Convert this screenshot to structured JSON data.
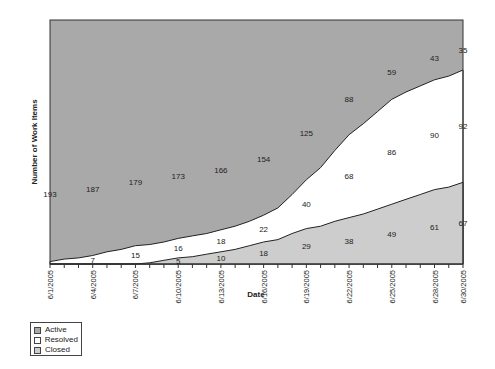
{
  "chart_data": {
    "type": "area",
    "stacked": true,
    "title": "",
    "xlabel": "Date",
    "ylabel": "Number of Work Items",
    "ylim": [
      0,
      200
    ],
    "x": [
      "6/1/2005",
      "6/2/2005",
      "6/3/2005",
      "6/4/2005",
      "6/5/2005",
      "6/6/2005",
      "6/7/2005",
      "6/8/2005",
      "6/9/2005",
      "6/10/2005",
      "6/11/2005",
      "6/12/2005",
      "6/13/2005",
      "6/14/2005",
      "6/15/2005",
      "6/16/2005",
      "6/17/2005",
      "6/18/2005",
      "6/19/2005",
      "6/20/2005",
      "6/21/2005",
      "6/22/2005",
      "6/23/2005",
      "6/24/2005",
      "6/25/2005",
      "6/26/2005",
      "6/27/2005",
      "6/28/2005",
      "6/29/2005",
      "6/30/2005"
    ],
    "tick_labels": [
      "6/1/2005",
      "6/4/2005",
      "6/7/2005",
      "6/10/2005",
      "6/13/2005",
      "6/16/2005",
      "6/19/2005",
      "6/22/2005",
      "6/25/2005",
      "6/28/2005",
      "6/30/2005"
    ],
    "stack_order": [
      "Closed",
      "Resolved",
      "Active"
    ],
    "series": [
      {
        "name": "Closed",
        "color": "#cdcdcd",
        "values": [
          0,
          0,
          0,
          0,
          0,
          0,
          0,
          1,
          3,
          5,
          6,
          8,
          10,
          12,
          15,
          18,
          20,
          25,
          29,
          31,
          35,
          38,
          41,
          45,
          49,
          53,
          57,
          61,
          63,
          67
        ]
      },
      {
        "name": "Resolved",
        "color": "#ffffff",
        "values": [
          2,
          4,
          5,
          7,
          10,
          12,
          15,
          15,
          15,
          16,
          17,
          17,
          18,
          19,
          20,
          22,
          26,
          32,
          40,
          48,
          58,
          68,
          74,
          80,
          86,
          88,
          89,
          90,
          91,
          92
        ]
      },
      {
        "name": "Active",
        "color": "#a9a9a9",
        "values": [
          193,
          191,
          189,
          187,
          184,
          181,
          179,
          177,
          175,
          173,
          171,
          169,
          166,
          162,
          158,
          154,
          146,
          136,
          125,
          113,
          100,
          88,
          78,
          68,
          59,
          54,
          48,
          43,
          40,
          35
        ]
      }
    ],
    "data_labels": {
      "Active": [
        {
          "x": "6/1/2005",
          "value": 193
        },
        {
          "x": "6/4/2005",
          "value": 187
        },
        {
          "x": "6/7/2005",
          "value": 179
        },
        {
          "x": "6/10/2005",
          "value": 173
        },
        {
          "x": "6/13/2005",
          "value": 166
        },
        {
          "x": "6/16/2005",
          "value": 154
        },
        {
          "x": "6/19/2005",
          "value": 125
        },
        {
          "x": "6/22/2005",
          "value": 88
        },
        {
          "x": "6/25/2005",
          "value": 59
        },
        {
          "x": "6/28/2005",
          "value": 43
        },
        {
          "x": "6/30/2005",
          "value": 35
        }
      ],
      "Resolved": [
        {
          "x": "6/4/2005",
          "value": 7
        },
        {
          "x": "6/7/2005",
          "value": 15
        },
        {
          "x": "6/10/2005",
          "value": 16
        },
        {
          "x": "6/13/2005",
          "value": 18
        },
        {
          "x": "6/16/2005",
          "value": 22
        },
        {
          "x": "6/19/2005",
          "value": 40
        },
        {
          "x": "6/22/2005",
          "value": 68
        },
        {
          "x": "6/25/2005",
          "value": 86
        },
        {
          "x": "6/28/2005",
          "value": 90
        },
        {
          "x": "6/30/2005",
          "value": 92
        }
      ],
      "Closed": [
        {
          "x": "6/10/2005",
          "value": 5
        },
        {
          "x": "6/13/2005",
          "value": 10
        },
        {
          "x": "6/16/2005",
          "value": 18
        },
        {
          "x": "6/19/2005",
          "value": 29
        },
        {
          "x": "6/22/2005",
          "value": 38
        },
        {
          "x": "6/25/2005",
          "value": 49
        },
        {
          "x": "6/28/2005",
          "value": 61
        },
        {
          "x": "6/30/2005",
          "value": 67
        }
      ]
    },
    "legend": {
      "position": "bottom-left",
      "entries": [
        "Active",
        "Resolved",
        "Closed"
      ]
    },
    "grid": false
  },
  "legend": {
    "items": [
      {
        "label": "Active",
        "color": "#a9a9a9"
      },
      {
        "label": "Resolved",
        "color": "#ffffff"
      },
      {
        "label": "Closed",
        "color": "#cdcdcd"
      }
    ]
  },
  "axes": {
    "x_title": "Date",
    "y_title": "Number of Work Items"
  }
}
